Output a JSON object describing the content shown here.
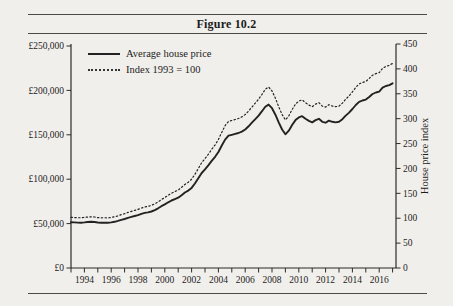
{
  "figure": {
    "title": "Figure 10.2"
  },
  "legend": {
    "series1_label": "Average house price",
    "series2_label": "Index 1993 = 100"
  },
  "colors": {
    "line": "#222222",
    "axis": "#2b2b2b",
    "text": "#1c1c1c",
    "page_bg": "#f1efeb"
  },
  "chart_data": {
    "type": "line",
    "title": "Figure 10.2",
    "x_start": 1993,
    "x_step": 0.25,
    "x_axis": {
      "min": 1993,
      "max": 2017,
      "tick_years": [
        1993,
        1994,
        1995,
        1996,
        1997,
        1998,
        1999,
        2000,
        2001,
        2002,
        2003,
        2004,
        2005,
        2006,
        2007,
        2008,
        2009,
        2010,
        2011,
        2012,
        2013,
        2014,
        2015,
        2016,
        2017
      ],
      "label_years": [
        "1994",
        "1996",
        "1998",
        "2000",
        "2002",
        "2004",
        "2006",
        "2008",
        "2010",
        "2012",
        "2014",
        "2016"
      ]
    },
    "left_axis": {
      "title": "",
      "min": 0,
      "max": 250000,
      "tick_values": [
        0,
        50000,
        100000,
        150000,
        200000,
        250000
      ],
      "tick_labels": [
        "£0",
        "£50,000",
        "£100,000",
        "£150,000",
        "£200,000",
        "£250,000"
      ]
    },
    "right_axis": {
      "title": "House price index",
      "min": 0,
      "max": 450,
      "tick_values": [
        0,
        50,
        100,
        150,
        200,
        250,
        300,
        350,
        400,
        450
      ],
      "tick_labels": [
        "0",
        "50",
        "100",
        "150",
        "200",
        "250",
        "300",
        "350",
        "400",
        "450"
      ]
    },
    "legend_position": "top-left-inside",
    "grid": false,
    "series": [
      {
        "name": "Average house price",
        "axis": "left",
        "style": "solid",
        "values": [
          51500,
          51300,
          51100,
          51000,
          51400,
          51800,
          52000,
          51800,
          51200,
          51000,
          51100,
          50900,
          51300,
          52000,
          53000,
          54300,
          55200,
          56500,
          57600,
          58600,
          59600,
          61000,
          62000,
          62600,
          63600,
          65200,
          67200,
          69600,
          71600,
          74000,
          76000,
          77600,
          79200,
          82000,
          85000,
          87200,
          90200,
          95200,
          101000,
          107000,
          111200,
          115600,
          120600,
          125200,
          130600,
          138000,
          144600,
          149000,
          150000,
          151000,
          152000,
          153600,
          156000,
          159600,
          163600,
          167600,
          171600,
          176600,
          181600,
          184000,
          180000,
          172600,
          164000,
          156000,
          150600,
          154600,
          161000,
          166600,
          169600,
          171000,
          168000,
          165600,
          164000,
          166600,
          168000,
          164600,
          163600,
          166000,
          164600,
          164000,
          164600,
          167600,
          171600,
          175000,
          179000,
          183600,
          187000,
          188600,
          189600,
          192600,
          196000,
          197600,
          198600,
          203000,
          205000,
          206000,
          208000
        ]
      },
      {
        "name": "Index 1993 = 100",
        "axis": "right",
        "style": "dotted",
        "values": [
          101.8,
          101.4,
          101.0,
          100.8,
          101.6,
          102.4,
          102.8,
          102.4,
          101.2,
          100.8,
          101.0,
          100.6,
          101.4,
          102.8,
          104.7,
          107.3,
          109.1,
          111.7,
          113.8,
          115.8,
          117.8,
          120.6,
          122.5,
          123.7,
          125.7,
          128.9,
          132.8,
          137.5,
          141.5,
          146.2,
          150.2,
          153.4,
          156.5,
          162.1,
          168.0,
          172.3,
          178.3,
          188.1,
          199.6,
          211.5,
          219.8,
          228.5,
          238.3,
          247.4,
          258.1,
          272.7,
          285.8,
          294.5,
          296.4,
          298.4,
          300.4,
          303.6,
          308.3,
          315.4,
          323.3,
          331.2,
          339.1,
          349.0,
          358.9,
          363.6,
          355.7,
          341.1,
          324.1,
          308.3,
          297.6,
          305.5,
          318.2,
          329.2,
          335.2,
          338.0,
          332.0,
          327.3,
          324.1,
          329.2,
          332.0,
          325.3,
          323.3,
          328.1,
          325.3,
          324.1,
          325.3,
          331.2,
          339.1,
          345.8,
          353.8,
          362.8,
          369.6,
          372.7,
          374.7,
          380.6,
          387.4,
          390.5,
          392.5,
          401.2,
          405.1,
          407.1,
          411.1
        ]
      }
    ]
  }
}
